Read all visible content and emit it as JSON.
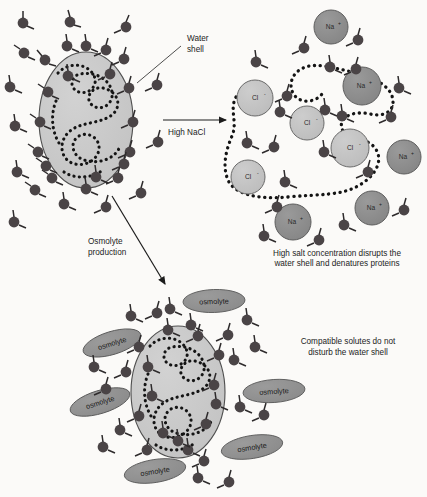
{
  "figure": {
    "background_color": "#fbfaf8"
  },
  "labels": {
    "water_shell": "Water",
    "water_shell_2": "shell",
    "high_nacl": "High NaCl",
    "osmolyte_production": "Osmolyte",
    "osmolyte_production_2": "production",
    "caption_salt_1": "High salt concentration disrupts the",
    "caption_salt_2": "water shell and denatures proteins",
    "caption_osmolyte_1": "Compatible solutes do not",
    "caption_osmolyte_2": "disturb the water shell"
  },
  "species": {
    "water_molecule": "water-molecule",
    "sodium_label": "Na",
    "sodium_charge": "+",
    "chloride_label": "Cl",
    "chloride_charge": "-",
    "osmolyte_label": "osmolyte",
    "protein_label": "protein"
  },
  "colors": {
    "protein_fill": "#c9c9c9",
    "protein_stroke": "#4a4a4a",
    "water_fill": "#4a4446",
    "sodium_fill": "#8c8c8c",
    "chloride_fill": "#c2c2c2",
    "osmolyte_fill": "#8f8f8f",
    "ion_stroke": "#4d4d4d",
    "chain_dot": "#141414",
    "arrow": "#1c1c1c",
    "text": "#1c1c1c",
    "background": "#fbfaf8"
  },
  "panels": [
    {
      "id": "panel-native-protein",
      "name": "Native protein with intact water shell",
      "position": "top-left",
      "protein": {
        "cx": 86,
        "cy": 120,
        "rx": 47,
        "ry": 68
      },
      "water_molecule_count": 33,
      "caption": null
    },
    {
      "id": "panel-high-salt",
      "name": "Denatured protein in high salt",
      "position": "top-right",
      "sodium_ions": 5,
      "chloride_ions": 5,
      "water_molecule_count": 21,
      "caption": "High salt concentration disrupts the water shell and denatures proteins"
    },
    {
      "id": "panel-osmolyte",
      "name": "Protein protected by compatible solutes",
      "position": "bottom",
      "protein": {
        "cx": 178,
        "cy": 392,
        "rx": 47,
        "ry": 66
      },
      "osmolyte_count": 6,
      "water_molecule_count": 32,
      "caption": "Compatible solutes do not disturb the water shell"
    }
  ],
  "arrows": [
    {
      "id": "arrow-high-nacl",
      "label": "High NaCl",
      "direction": "right",
      "from": [
        163,
        122
      ],
      "to": [
        227,
        122
      ]
    },
    {
      "id": "arrow-osmolyte-production",
      "label": "Osmolyte production",
      "direction": "down-right",
      "from": [
        112,
        195
      ],
      "to": [
        166,
        285
      ]
    }
  ],
  "ions": {
    "sodium": [
      {
        "x": 331,
        "y": 27,
        "r": 17
      },
      {
        "x": 362,
        "y": 85,
        "r": 19
      },
      {
        "x": 404,
        "y": 156,
        "r": 17
      },
      {
        "x": 372,
        "y": 207,
        "r": 17
      },
      {
        "x": 293,
        "y": 222,
        "r": 18
      }
    ],
    "chloride": [
      {
        "x": 255,
        "y": 98,
        "r": 18
      },
      {
        "x": 307,
        "y": 122,
        "r": 17
      },
      {
        "x": 349,
        "y": 148,
        "r": 19
      },
      {
        "x": 248,
        "y": 176,
        "r": 17
      }
    ]
  },
  "osmolytes": [
    {
      "x": 214,
      "y": 301,
      "rx": 31,
      "ry": 11,
      "rot": -2
    },
    {
      "x": 112,
      "y": 343,
      "rx": 30,
      "ry": 11,
      "rot": -16
    },
    {
      "x": 100,
      "y": 402,
      "rx": 31,
      "ry": 11,
      "rot": -16
    },
    {
      "x": 274,
      "y": 391,
      "rx": 31,
      "ry": 11,
      "rot": -4
    },
    {
      "x": 252,
      "y": 447,
      "rx": 31,
      "ry": 11,
      "rot": -8
    },
    {
      "x": 155,
      "y": 471,
      "rx": 31,
      "ry": 11,
      "rot": -8
    }
  ]
}
